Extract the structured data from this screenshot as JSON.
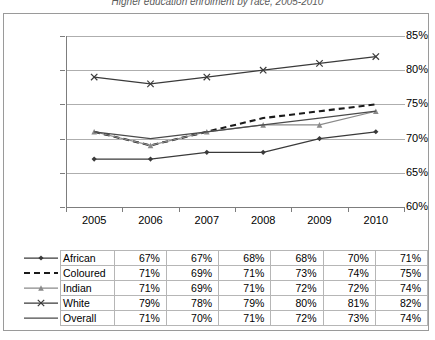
{
  "title": "Higher education enrolment by race, 2005-2010",
  "chart_data": {
    "type": "line",
    "title": "Higher education enrolment by race, 2005-2010",
    "xlabel": "",
    "ylabel": "",
    "categories": [
      "2005",
      "2006",
      "2007",
      "2008",
      "2009",
      "2010"
    ],
    "ylim": [
      60,
      85
    ],
    "ytick_labels": [
      "60%",
      "65%",
      "70%",
      "75%",
      "80%",
      "85%"
    ],
    "ytick_values": [
      60,
      65,
      70,
      75,
      80,
      85
    ],
    "grid": true,
    "legend_position": "bottom-table",
    "series": [
      {
        "name": "African",
        "marker": "diamond",
        "dash": "solid",
        "color": "#3a3a3a",
        "values": [
          67,
          67,
          68,
          68,
          70,
          71
        ],
        "labels": [
          "67%",
          "67%",
          "68%",
          "68%",
          "70%",
          "71%"
        ]
      },
      {
        "name": "Coloured",
        "marker": "none",
        "dash": "dashed",
        "color": "#1a1a1a",
        "values": [
          71,
          69,
          71,
          73,
          74,
          75
        ],
        "labels": [
          "71%",
          "69%",
          "71%",
          "73%",
          "74%",
          "75%"
        ]
      },
      {
        "name": "Indian",
        "marker": "triangle",
        "dash": "solid",
        "color": "#8a8a8a",
        "values": [
          71,
          69,
          71,
          72,
          72,
          74
        ],
        "labels": [
          "71%",
          "69%",
          "71%",
          "72%",
          "72%",
          "74%"
        ]
      },
      {
        "name": "White",
        "marker": "cross",
        "dash": "solid",
        "color": "#3a3a3a",
        "values": [
          79,
          78,
          79,
          80,
          81,
          82
        ],
        "labels": [
          "79%",
          "78%",
          "79%",
          "80%",
          "81%",
          "82%"
        ]
      },
      {
        "name": "Overall",
        "marker": "none",
        "dash": "solid",
        "color": "#4a4a4a",
        "values": [
          71,
          70,
          71,
          72,
          73,
          74
        ],
        "labels": [
          "71%",
          "70%",
          "71%",
          "72%",
          "73%",
          "74%"
        ]
      }
    ]
  },
  "table": {
    "rows": [
      {
        "name": "African",
        "values": [
          "67%",
          "67%",
          "68%",
          "68%",
          "70%",
          "71%"
        ]
      },
      {
        "name": "Coloured",
        "values": [
          "71%",
          "69%",
          "71%",
          "73%",
          "74%",
          "75%"
        ]
      },
      {
        "name": "Indian",
        "values": [
          "71%",
          "69%",
          "71%",
          "72%",
          "72%",
          "74%"
        ]
      },
      {
        "name": "White",
        "values": [
          "79%",
          "78%",
          "79%",
          "80%",
          "81%",
          "82%"
        ]
      },
      {
        "name": "Overall",
        "values": [
          "71%",
          "70%",
          "71%",
          "72%",
          "73%",
          "74%"
        ]
      }
    ]
  },
  "colors": {
    "gridline": "#aeaeae",
    "axis": "#7d7d7d",
    "frame_border": "#9a9a9a",
    "table_border": "#b6b6b6",
    "dark_series": "#3a3a3a",
    "gray_series": "#8a8a8a"
  }
}
